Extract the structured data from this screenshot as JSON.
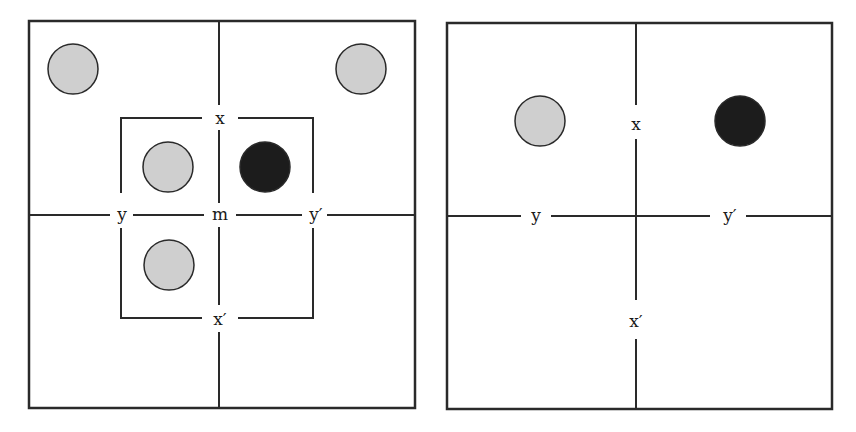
{
  "colors": {
    "line": "#2a2a2a",
    "gray_fill": "#cfcfcf",
    "black_fill": "#1c1c1c",
    "background": "#ffffff"
  },
  "panels": [
    {
      "id": "left",
      "labels": {
        "top": "x",
        "bottom": "x′",
        "left": "y",
        "right": "y′",
        "center": "m"
      },
      "circles": [
        {
          "position": "outer-top-left",
          "fill": "gray"
        },
        {
          "position": "outer-top-right",
          "fill": "gray"
        },
        {
          "position": "inner-top-left",
          "fill": "gray"
        },
        {
          "position": "inner-top-right",
          "fill": "black"
        },
        {
          "position": "inner-bottom-left",
          "fill": "gray"
        }
      ]
    },
    {
      "id": "right",
      "labels": {
        "top": "x",
        "bottom": "x′",
        "left": "y",
        "right": "y′"
      },
      "circles": [
        {
          "position": "top-left",
          "fill": "gray"
        },
        {
          "position": "top-right",
          "fill": "black"
        }
      ]
    }
  ]
}
